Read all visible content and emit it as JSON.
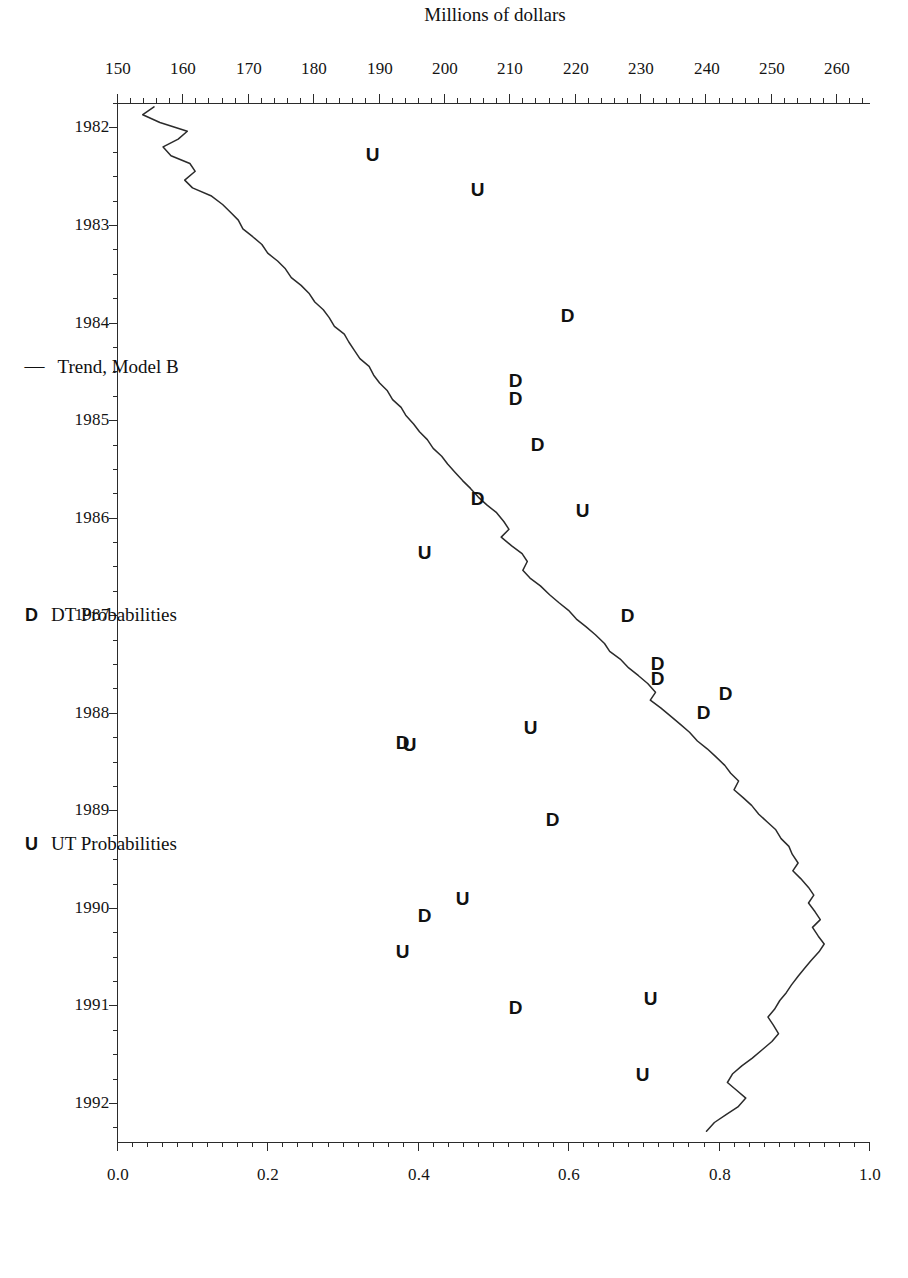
{
  "chart_data": {
    "type": "line",
    "title": "",
    "orientation": "rotated-90-clockwise",
    "xlabel": "",
    "ylabel": "Millions of dollars",
    "y2label": "",
    "x": [
      1982,
      1983,
      1984,
      1985,
      1986,
      1987,
      1988,
      1989,
      1990,
      1991,
      1992
    ],
    "xlim": [
      1981.75,
      1992.4
    ],
    "ylim": [
      150,
      265
    ],
    "y_ticks": [
      150,
      160,
      170,
      180,
      190,
      200,
      210,
      220,
      230,
      240,
      250,
      260
    ],
    "prob_lim": [
      0.0,
      1.0
    ],
    "prob_ticks": [
      0.0,
      0.2,
      0.4,
      0.6,
      0.8,
      1.0
    ],
    "grid": false,
    "legend_position": "below-axis",
    "series": [
      {
        "name": "Trend, Model B",
        "type": "line",
        "unit": "Millions of dollars",
        "points": [
          [
            1981.79,
            155.5
          ],
          [
            1981.87,
            153.8
          ],
          [
            1981.95,
            156.4
          ],
          [
            1982.04,
            160.6
          ],
          [
            1982.12,
            159.2
          ],
          [
            1982.2,
            156.9
          ],
          [
            1982.29,
            158.1
          ],
          [
            1982.37,
            161.0
          ],
          [
            1982.45,
            161.8
          ],
          [
            1982.54,
            160.2
          ],
          [
            1982.62,
            161.4
          ],
          [
            1982.7,
            164.2
          ],
          [
            1982.79,
            166.0
          ],
          [
            1982.87,
            167.2
          ],
          [
            1982.95,
            168.4
          ],
          [
            1983.04,
            169.1
          ],
          [
            1983.12,
            170.6
          ],
          [
            1983.2,
            172.0
          ],
          [
            1983.29,
            172.9
          ],
          [
            1983.37,
            174.4
          ],
          [
            1983.45,
            175.6
          ],
          [
            1983.54,
            176.5
          ],
          [
            1983.62,
            178.0
          ],
          [
            1983.7,
            179.2
          ],
          [
            1983.79,
            180.1
          ],
          [
            1983.87,
            181.4
          ],
          [
            1983.95,
            182.3
          ],
          [
            1984.04,
            183.1
          ],
          [
            1984.12,
            184.6
          ],
          [
            1984.2,
            185.3
          ],
          [
            1984.29,
            186.2
          ],
          [
            1984.37,
            187.0
          ],
          [
            1984.45,
            188.4
          ],
          [
            1984.54,
            189.1
          ],
          [
            1984.62,
            190.0
          ],
          [
            1984.7,
            191.2
          ],
          [
            1984.79,
            192.0
          ],
          [
            1984.87,
            193.3
          ],
          [
            1984.95,
            194.0
          ],
          [
            1985.04,
            195.2
          ],
          [
            1985.12,
            196.1
          ],
          [
            1985.2,
            197.3
          ],
          [
            1985.29,
            198.2
          ],
          [
            1985.37,
            199.5
          ],
          [
            1985.45,
            200.4
          ],
          [
            1985.54,
            201.6
          ],
          [
            1985.62,
            202.7
          ],
          [
            1985.7,
            203.9
          ],
          [
            1985.79,
            205.1
          ],
          [
            1985.87,
            206.4
          ],
          [
            1985.95,
            207.9
          ],
          [
            1986.04,
            209.0
          ],
          [
            1986.12,
            209.8
          ],
          [
            1986.2,
            208.6
          ],
          [
            1986.29,
            210.2
          ],
          [
            1986.37,
            211.8
          ],
          [
            1986.45,
            212.6
          ],
          [
            1986.54,
            211.9
          ],
          [
            1986.62,
            213.0
          ],
          [
            1986.7,
            214.6
          ],
          [
            1986.79,
            216.0
          ],
          [
            1986.87,
            217.4
          ],
          [
            1986.95,
            218.9
          ],
          [
            1987.04,
            220.1
          ],
          [
            1987.12,
            221.6
          ],
          [
            1987.2,
            223.0
          ],
          [
            1987.29,
            224.4
          ],
          [
            1987.37,
            225.2
          ],
          [
            1987.45,
            226.8
          ],
          [
            1987.54,
            228.1
          ],
          [
            1987.62,
            229.6
          ],
          [
            1987.7,
            231.0
          ],
          [
            1987.79,
            232.2
          ],
          [
            1987.87,
            231.4
          ],
          [
            1987.95,
            233.0
          ],
          [
            1988.04,
            234.6
          ],
          [
            1988.12,
            236.0
          ],
          [
            1988.2,
            237.4
          ],
          [
            1988.29,
            238.6
          ],
          [
            1988.37,
            240.1
          ],
          [
            1988.45,
            241.4
          ],
          [
            1988.54,
            242.8
          ],
          [
            1988.62,
            243.7
          ],
          [
            1988.7,
            244.9
          ],
          [
            1988.79,
            244.2
          ],
          [
            1988.87,
            245.6
          ],
          [
            1988.95,
            246.9
          ],
          [
            1989.04,
            248.0
          ],
          [
            1989.12,
            249.3
          ],
          [
            1989.2,
            250.6
          ],
          [
            1989.29,
            251.4
          ],
          [
            1989.37,
            252.6
          ],
          [
            1989.45,
            253.1
          ],
          [
            1989.54,
            254.0
          ],
          [
            1989.62,
            253.2
          ],
          [
            1989.7,
            254.4
          ],
          [
            1989.79,
            255.6
          ],
          [
            1989.87,
            256.4
          ],
          [
            1989.95,
            255.6
          ],
          [
            1990.04,
            256.6
          ],
          [
            1990.12,
            257.4
          ],
          [
            1990.2,
            256.2
          ],
          [
            1990.29,
            257.1
          ],
          [
            1990.37,
            258.0
          ],
          [
            1990.45,
            257.2
          ],
          [
            1990.54,
            256.0
          ],
          [
            1990.62,
            255.0
          ],
          [
            1990.7,
            254.0
          ],
          [
            1990.79,
            253.0
          ],
          [
            1990.87,
            252.2
          ],
          [
            1990.95,
            251.2
          ],
          [
            1991.04,
            250.4
          ],
          [
            1991.12,
            249.4
          ],
          [
            1991.2,
            250.2
          ],
          [
            1991.29,
            251.0
          ],
          [
            1991.37,
            250.0
          ],
          [
            1991.45,
            248.6
          ],
          [
            1991.54,
            247.0
          ],
          [
            1991.62,
            245.4
          ],
          [
            1991.7,
            244.0
          ],
          [
            1991.79,
            243.2
          ],
          [
            1991.87,
            244.6
          ],
          [
            1991.95,
            246.0
          ],
          [
            1992.04,
            244.8
          ],
          [
            1992.12,
            243.0
          ],
          [
            1992.2,
            241.2
          ],
          [
            1992.29,
            240.0
          ]
        ]
      },
      {
        "name": "DT Probabilities",
        "type": "marker",
        "symbol": "D",
        "unit": "probability",
        "points": [
          [
            1983.95,
            0.62
          ],
          [
            1984.62,
            0.55
          ],
          [
            1984.8,
            0.55
          ],
          [
            1985.28,
            0.58
          ],
          [
            1985.83,
            0.5
          ],
          [
            1987.03,
            0.7
          ],
          [
            1987.52,
            0.74
          ],
          [
            1987.67,
            0.74
          ],
          [
            1987.83,
            0.83
          ],
          [
            1988.02,
            0.8
          ],
          [
            1988.33,
            0.4
          ],
          [
            1989.12,
            0.6
          ],
          [
            1990.1,
            0.43
          ],
          [
            1991.05,
            0.55
          ]
        ]
      },
      {
        "name": "UT Probabilities",
        "type": "marker",
        "symbol": "U",
        "unit": "probability",
        "points": [
          [
            1982.3,
            0.36
          ],
          [
            1982.66,
            0.5
          ],
          [
            1985.95,
            0.64
          ],
          [
            1986.38,
            0.43
          ],
          [
            1988.18,
            0.57
          ],
          [
            1988.35,
            0.41
          ],
          [
            1989.93,
            0.48
          ],
          [
            1990.47,
            0.4
          ],
          [
            1990.95,
            0.73
          ],
          [
            1991.73,
            0.72
          ]
        ]
      }
    ]
  },
  "axes": {
    "value_axis": {
      "title": "Millions of dollars",
      "ticks": [
        "260",
        "250",
        "240",
        "230",
        "220",
        "210",
        "200",
        "190",
        "180",
        "170",
        "160",
        "150"
      ]
    },
    "probability_axis": {
      "title": "",
      "ticks": [
        "1.0",
        "0.8",
        "0.6",
        "0.4",
        "0.2",
        "0.0"
      ]
    },
    "time_axis": {
      "title": "",
      "ticks": [
        "1982",
        "1983",
        "1984",
        "1985",
        "1986",
        "1987",
        "1988",
        "1989",
        "1990",
        "1991",
        "1992"
      ]
    }
  },
  "legend": {
    "items": [
      {
        "symbol": "—",
        "label": "Trend, Model B",
        "kind": "dash"
      },
      {
        "symbol": "D",
        "label": "DT Probabilities",
        "kind": "letter"
      },
      {
        "symbol": "U",
        "label": "UT Probabilities",
        "kind": "letter"
      }
    ]
  },
  "colors": {
    "line": "#2b2b2b",
    "text": "#141414",
    "background": "#ffffff"
  }
}
